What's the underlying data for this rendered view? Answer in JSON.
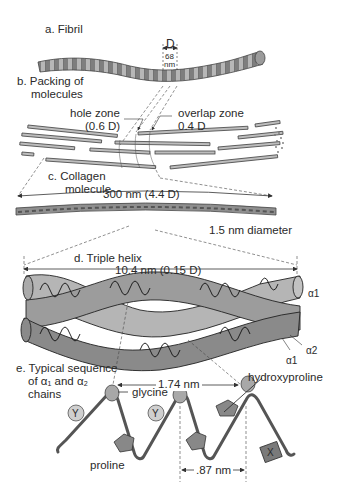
{
  "figure": {
    "panels": [
      {
        "id": "a",
        "label": "a. Fibril"
      },
      {
        "id": "b",
        "label_line1": "b. Packing of",
        "label_line2": "molecules"
      },
      {
        "id": "c",
        "label_line1": "c. Collagen",
        "label_line2": "molecule"
      },
      {
        "id": "d",
        "label": "d. Triple helix"
      },
      {
        "id": "e",
        "label_line1": "e. Typical sequence",
        "label_line2": "of α₁ and α₂",
        "label_line3": "chains"
      }
    ],
    "fibril": {
      "period_symbol": "D",
      "period_value": "68",
      "period_unit": "nm"
    },
    "packing": {
      "hole_zone": "hole zone",
      "hole_zone_value": "(0.6 D)",
      "overlap_zone": "overlap zone",
      "overlap_zone_value": "0.4 D"
    },
    "molecule": {
      "length": "300 nm (4.4 D)",
      "diameter": "1.5 nm diameter"
    },
    "triple_helix": {
      "pitch": "10.4 nm (0.15 D)",
      "chain_a1_top": "α1",
      "chain_a2": "α2",
      "chain_a1_bottom": "α1"
    },
    "sequence": {
      "repeat_distance": "1.74 nm",
      "residue_distance": ".87 nm",
      "glycine": "glycine",
      "hydroxyproline": "hydroxyproline",
      "proline": "proline",
      "residue_y": "Y",
      "residue_x": "X"
    }
  },
  "colors": {
    "fibril_fill": "#8a8a8a",
    "helix_light": "#b9b9b9",
    "helix_dark": "#8c8c8c",
    "line": "#333333",
    "residue": "#9a9a9a"
  }
}
